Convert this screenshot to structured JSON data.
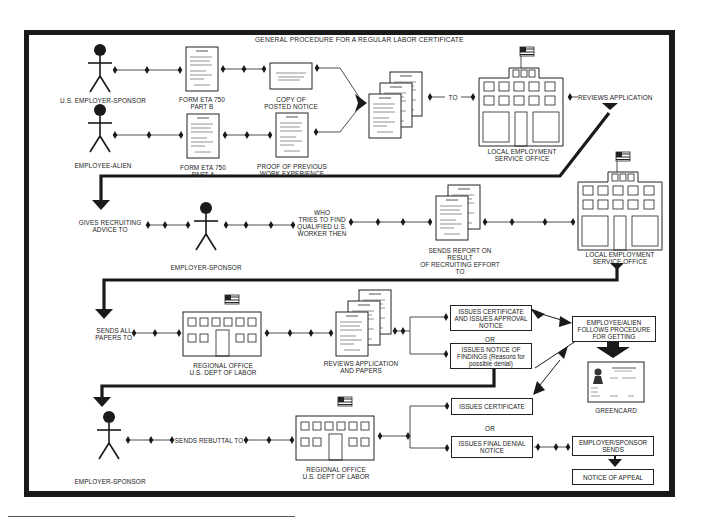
{
  "title": "GENERAL PROCEDURE FOR A REGULAR LABOR CERTIFICATE",
  "row1": {
    "actor_top": "U.S. EMPLOYER-SPONSOR",
    "actor_bottom": "EMPLOYEE-ALIEN",
    "form_b": [
      "FORM ETA 750",
      "PART B"
    ],
    "form_a": [
      "FORM ETA 750",
      "PART A"
    ],
    "posted_notice": [
      "COPY OF",
      "POSTED NOTICE"
    ],
    "work_proof": [
      "PROOF OF PREVIOUS",
      "WORK EXPERIENCE"
    ],
    "to_label": "TO",
    "office": [
      "LOCAL EMPLOYMENT",
      "SERVICE OFFICE"
    ],
    "reviews": "REVIEWS APPLICATION"
  },
  "row2": {
    "gives_advice": [
      "GIVES RECRUITING",
      "ADVICE TO"
    ],
    "actor": "EMPLOYER-SPONSOR",
    "who_tries": [
      "WHO",
      "TRIES TO FIND",
      "QUALIFIED U.S.",
      "WORKER THEN"
    ],
    "sends_report": [
      "SENDS REPORT ON",
      "RESULT",
      "OF RECRUITING EFFORT",
      "TO"
    ],
    "office": [
      "LOCAL EMPLOYMENT",
      "SERVICE OFFICE"
    ]
  },
  "row3": {
    "sends_all": [
      "SENDS ALL",
      "PAPERS TO"
    ],
    "regional": [
      "REGIONAL OFFICE",
      "U.S. DEPT OF LABOR"
    ],
    "reviews_papers": [
      "REVIEWS APPLICATION",
      "AND PAPERS"
    ],
    "issues_cert_approval": "ISSUES CERTIFICATE AND ISSUES APPROVAL NOTICE",
    "or": "OR",
    "issues_findings": "ISSUES NOTICE OF FINDINGS (Reasons for possible denial)",
    "employee_follows": "EMPLOYEE/ALIEN FOLLOWS PROCEDURE FOR GETTING",
    "greencard": "GREENCARD"
  },
  "row4": {
    "actor": "EMPLOYER-SPONSOR",
    "sends_rebuttal": "SENDS REBUTTAL TO",
    "regional": [
      "REGIONAL OFFICE",
      "U.S. DEPT OF LABOR"
    ],
    "issues_certificate": "ISSUES CERTIFICATE",
    "or": "OR",
    "final_denial": "ISSUES FINAL DENIAL NOTICE",
    "sponsor_sends": "EMPLOYER/SPONSOR SENDS",
    "notice_appeal": "NOTICE OF APPEAL"
  },
  "icons": {
    "actor": "stick-figure-icon",
    "document": "document-icon",
    "building": "office-building-icon",
    "flag": "us-flag-icon",
    "connector": "diamond-node-icon",
    "greencard": "greencard-icon"
  },
  "colors": {
    "ink": "#1a1a1a",
    "paper": "#ffffff"
  }
}
